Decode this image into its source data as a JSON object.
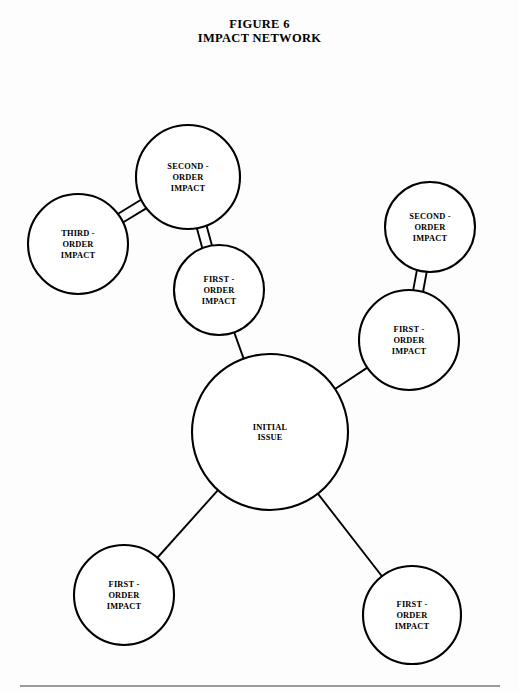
{
  "figure": {
    "title_line_1": "FIGURE 6",
    "title_line_2": "IMPACT NETWORK"
  },
  "chart_data": {
    "type": "diagram",
    "title": "IMPACT NETWORK",
    "subtitle": "FIGURE 6",
    "layout": "radial node-link network",
    "grid": false,
    "legend": "none",
    "canvas": {
      "width": 519,
      "height": 693
    },
    "nodes": [
      {
        "id": "initial-issue",
        "label_lines": [
          "INITIAL",
          "ISSUE"
        ],
        "tier": "initial",
        "cx": 270,
        "cy": 432,
        "r": 78
      },
      {
        "id": "first-order-upper-left",
        "label_lines": [
          "FIRST -",
          "ORDER",
          "IMPACT"
        ],
        "tier": "first",
        "cx": 219,
        "cy": 290,
        "r": 45
      },
      {
        "id": "first-order-right",
        "label_lines": [
          "FIRST -",
          "ORDER",
          "IMPACT"
        ],
        "tier": "first",
        "cx": 409,
        "cy": 340,
        "r": 50
      },
      {
        "id": "first-order-bottom-left",
        "label_lines": [
          "FIRST -",
          "ORDER",
          "IMPACT"
        ],
        "tier": "first",
        "cx": 124,
        "cy": 595,
        "r": 50
      },
      {
        "id": "first-order-bottom-right",
        "label_lines": [
          "FIRST -",
          "ORDER",
          "IMPACT"
        ],
        "tier": "first",
        "cx": 412,
        "cy": 615,
        "r": 49
      },
      {
        "id": "second-order-upper-left",
        "label_lines": [
          "SECOND -",
          "ORDER",
          "IMPACT"
        ],
        "tier": "second",
        "cx": 188,
        "cy": 177,
        "r": 52
      },
      {
        "id": "second-order-upper-right",
        "label_lines": [
          "SECOND -",
          "ORDER",
          "IMPACT"
        ],
        "tier": "second",
        "cx": 430,
        "cy": 227,
        "r": 45
      },
      {
        "id": "third-order-left",
        "label_lines": [
          "THIRD -",
          "ORDER",
          "IMPACT"
        ],
        "tier": "third",
        "cx": 78,
        "cy": 244,
        "r": 50
      }
    ],
    "edges": [
      {
        "id": "edge-initial-to-first-upper-left",
        "from": "initial-issue",
        "to": "first-order-upper-left",
        "style": "single"
      },
      {
        "id": "edge-initial-to-first-right",
        "from": "initial-issue",
        "to": "first-order-right",
        "style": "single"
      },
      {
        "id": "edge-initial-to-first-bottom-left",
        "from": "initial-issue",
        "to": "first-order-bottom-left",
        "style": "single"
      },
      {
        "id": "edge-initial-to-first-bottom-right",
        "from": "initial-issue",
        "to": "first-order-bottom-right",
        "style": "single"
      },
      {
        "id": "edge-first-upper-left-to-second-upper-left",
        "from": "first-order-upper-left",
        "to": "second-order-upper-left",
        "style": "double"
      },
      {
        "id": "edge-first-right-to-second-upper-right",
        "from": "first-order-right",
        "to": "second-order-upper-right",
        "style": "double"
      },
      {
        "id": "edge-second-upper-left-to-third-left",
        "from": "second-order-upper-left",
        "to": "third-order-left",
        "style": "double"
      }
    ],
    "footer_rule": {
      "x1": 20,
      "y1": 686,
      "x2": 500,
      "y2": 686
    }
  }
}
